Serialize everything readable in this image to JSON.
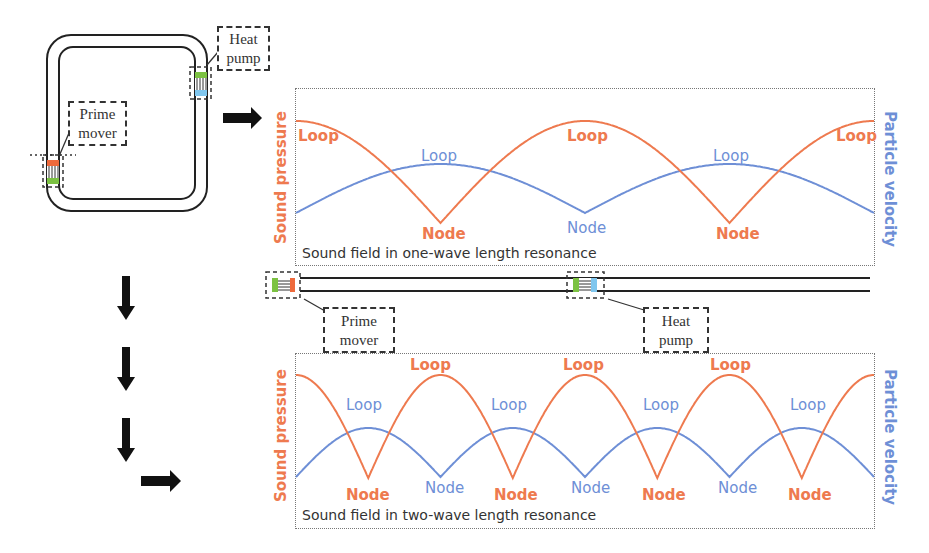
{
  "colors": {
    "sound_pressure": "#ee7a4f",
    "particle_velocity": "#6e8fd6",
    "ink": "#222222",
    "regenerator_hot": "#ee6a3c",
    "regenerator_cold_green": "#7cc242",
    "regenerator_cold_blue": "#7fc6ee"
  },
  "loop_device": {
    "prime_mover_label_line1": "Prime",
    "prime_mover_label_line2": "mover",
    "heat_pump_label_line1": "Heat",
    "heat_pump_label_line2": "pump"
  },
  "straight_device": {
    "prime_mover_label_line1": "Prime",
    "prime_mover_label_line2": "mover",
    "heat_pump_label_line1": "Heat",
    "heat_pump_label_line2": "pump"
  },
  "arrows": [
    {
      "name": "arrow-right-to-top-chart",
      "direction": "right"
    },
    {
      "name": "arrow-down-1",
      "direction": "down"
    },
    {
      "name": "arrow-down-2",
      "direction": "down"
    },
    {
      "name": "arrow-down-3",
      "direction": "down"
    },
    {
      "name": "arrow-right-to-bottom-chart",
      "direction": "right"
    }
  ],
  "top_chart": {
    "left_axis": "Sound pressure",
    "right_axis": "Particle velocity",
    "caption": "Sound field in one-wave length resonance",
    "labels": {
      "p_loop_1": "Loop",
      "p_loop_2": "Loop",
      "p_loop_3": "Loop",
      "p_node_1": "Node",
      "p_node_2": "Node",
      "u_loop_1": "Loop",
      "u_loop_2": "Loop",
      "u_node_1": "Node"
    }
  },
  "bottom_chart": {
    "left_axis": "Sound pressure",
    "right_axis": "Particle velocity",
    "caption": "Sound field in two-wave length resonance",
    "labels": {
      "p_loop_1": "Loop",
      "p_loop_2": "Loop",
      "p_loop_3": "Loop",
      "p_node_1": "Node",
      "p_node_2": "Node",
      "p_node_3": "Node",
      "p_node_4": "Node",
      "u_loop_1": "Loop",
      "u_loop_2": "Loop",
      "u_loop_3": "Loop",
      "u_loop_4": "Loop",
      "u_node_1": "Node",
      "u_node_2": "Node",
      "u_node_3": "Node"
    }
  },
  "chart_data": [
    {
      "type": "line",
      "title": "Sound field in one-wave length resonance",
      "xlabel": "",
      "ylabel": "Sound pressure",
      "ylabel_right": "Particle velocity",
      "x_range": [
        0,
        1
      ],
      "grid": false,
      "series": [
        {
          "name": "Sound pressure",
          "function": "|cos(2*pi*x)|",
          "loops_at_x": [
            0,
            0.5,
            1
          ],
          "nodes_at_x": [
            0.25,
            0.75
          ]
        },
        {
          "name": "Particle velocity",
          "function": "|sin(2*pi*x)|",
          "loops_at_x": [
            0.25,
            0.75
          ],
          "nodes_at_x": [
            0,
            0.5,
            1
          ]
        }
      ]
    },
    {
      "type": "line",
      "title": "Sound field in two-wave length resonance",
      "xlabel": "",
      "ylabel": "Sound pressure",
      "ylabel_right": "Particle velocity",
      "x_range": [
        0,
        1
      ],
      "grid": false,
      "series": [
        {
          "name": "Sound pressure",
          "function": "|cos(4*pi*x)|",
          "loops_at_x": [
            0,
            0.25,
            0.5,
            0.75,
            1
          ],
          "nodes_at_x": [
            0.125,
            0.375,
            0.625,
            0.875
          ]
        },
        {
          "name": "Particle velocity",
          "function": "|sin(4*pi*x)|",
          "loops_at_x": [
            0.125,
            0.375,
            0.625,
            0.875
          ],
          "nodes_at_x": [
            0,
            0.25,
            0.5,
            0.75,
            1
          ]
        }
      ]
    }
  ]
}
